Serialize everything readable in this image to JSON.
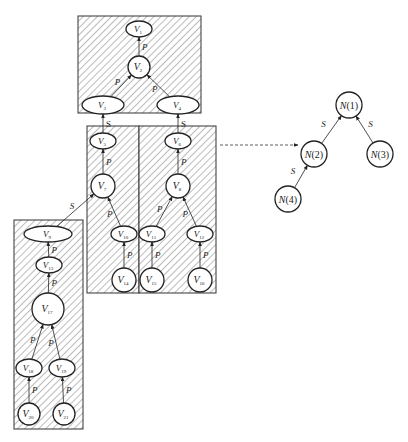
{
  "diagram": {
    "colors": {
      "stroke": "#333333",
      "hatch": "#555555",
      "node_fill": "#ffffff",
      "background": "#ffffff"
    },
    "groups": [
      {
        "id": "G1",
        "label": "",
        "nodes": [
          "V1",
          "V2",
          "V3",
          "V4"
        ]
      },
      {
        "id": "G2",
        "label": "",
        "nodes": [
          "V5",
          "V7",
          "V10",
          "V14"
        ]
      },
      {
        "id": "G3",
        "label": "",
        "nodes": [
          "V6",
          "V8",
          "V11",
          "V12",
          "V15",
          "V16"
        ]
      },
      {
        "id": "G4",
        "label": "",
        "nodes": [
          "V9",
          "V13",
          "V17",
          "V18",
          "V19",
          "V20",
          "V21"
        ]
      }
    ],
    "nodes": [
      {
        "id": "V1",
        "base": "V",
        "sub": "1"
      },
      {
        "id": "V2",
        "base": "V",
        "sub": "2"
      },
      {
        "id": "V3",
        "base": "V",
        "sub": "3"
      },
      {
        "id": "V4",
        "base": "V",
        "sub": "4"
      },
      {
        "id": "V5",
        "base": "V",
        "sub": "5"
      },
      {
        "id": "V6",
        "base": "V",
        "sub": "6"
      },
      {
        "id": "V7",
        "base": "V",
        "sub": "7"
      },
      {
        "id": "V8",
        "base": "V",
        "sub": "8"
      },
      {
        "id": "V9",
        "base": "V",
        "sub": "9"
      },
      {
        "id": "V10",
        "base": "V",
        "sub": "10"
      },
      {
        "id": "V11",
        "base": "V",
        "sub": "11"
      },
      {
        "id": "V12",
        "base": "V",
        "sub": "12"
      },
      {
        "id": "V13",
        "base": "V",
        "sub": "13"
      },
      {
        "id": "V14",
        "base": "V",
        "sub": "14"
      },
      {
        "id": "V15",
        "base": "V",
        "sub": "15"
      },
      {
        "id": "V16",
        "base": "V",
        "sub": "16"
      },
      {
        "id": "V17",
        "base": "V",
        "sub": "17"
      },
      {
        "id": "V18",
        "base": "V",
        "sub": "18"
      },
      {
        "id": "V19",
        "base": "V",
        "sub": "19"
      },
      {
        "id": "V20",
        "base": "V",
        "sub": "20"
      },
      {
        "id": "V21",
        "base": "V",
        "sub": "21"
      }
    ],
    "edges": [
      {
        "from": "V2",
        "to": "V1",
        "label": "P",
        "type": "solid"
      },
      {
        "from": "V3",
        "to": "V2",
        "label": "P",
        "type": "solid"
      },
      {
        "from": "V4",
        "to": "V2",
        "label": "P",
        "type": "solid"
      },
      {
        "from": "V5",
        "to": "V3",
        "label": "S",
        "type": "solid",
        "upright": true
      },
      {
        "from": "V6",
        "to": "V4",
        "label": "S",
        "type": "solid",
        "upright": true
      },
      {
        "from": "V7",
        "to": "V5",
        "label": "P",
        "type": "solid"
      },
      {
        "from": "V8",
        "to": "V6",
        "label": "P",
        "type": "solid"
      },
      {
        "from": "V9",
        "to": "V7",
        "label": "S",
        "type": "solid"
      },
      {
        "from": "V10",
        "to": "V7",
        "label": "P",
        "type": "solid"
      },
      {
        "from": "V11",
        "to": "V8",
        "label": "P",
        "type": "solid"
      },
      {
        "from": "V12",
        "to": "V8",
        "label": "P",
        "type": "solid"
      },
      {
        "from": "V13",
        "to": "V9",
        "label": "P",
        "type": "solid"
      },
      {
        "from": "V14",
        "to": "V10",
        "label": "P",
        "type": "solid"
      },
      {
        "from": "V15",
        "to": "V11",
        "label": "P",
        "type": "solid"
      },
      {
        "from": "V16",
        "to": "V12",
        "label": "P",
        "type": "solid"
      },
      {
        "from": "V17",
        "to": "V13",
        "label": "P",
        "type": "solid"
      },
      {
        "from": "V18",
        "to": "V17",
        "label": "P",
        "type": "solid"
      },
      {
        "from": "V19",
        "to": "V17",
        "label": "P",
        "type": "solid"
      },
      {
        "from": "V20",
        "to": "V18",
        "label": "P",
        "type": "solid"
      },
      {
        "from": "V21",
        "to": "V19",
        "label": "P",
        "type": "solid"
      }
    ],
    "mapping_arrow": {
      "style": "dashed",
      "from": "partitioned-graph",
      "to": "group-tree"
    },
    "tree": {
      "nodes": [
        {
          "id": "N1",
          "label": "N(1)"
        },
        {
          "id": "N2",
          "label": "N(2)"
        },
        {
          "id": "N3",
          "label": "N(3)"
        },
        {
          "id": "N4",
          "label": "N(4)"
        }
      ],
      "edges": [
        {
          "from": "N2",
          "to": "N1",
          "label": "S"
        },
        {
          "from": "N3",
          "to": "N1",
          "label": "S"
        },
        {
          "from": "N4",
          "to": "N2",
          "label": "S"
        }
      ]
    }
  }
}
